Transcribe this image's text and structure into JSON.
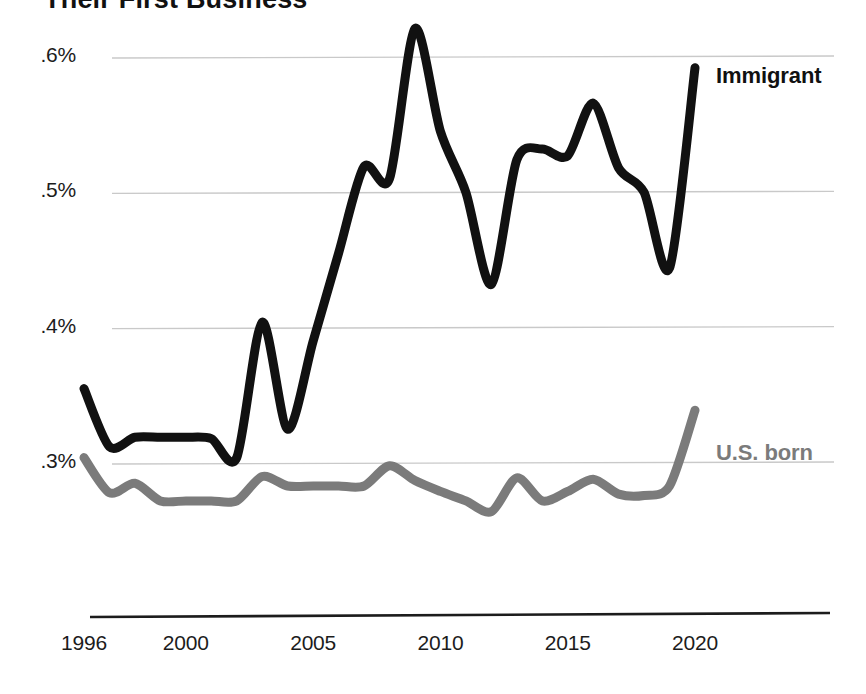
{
  "title": "Their First Business",
  "axes": {
    "y_ticks": [
      ".6%",
      ".5%",
      ".4%",
      ".3%"
    ],
    "x_ticks": [
      "1996",
      "2000",
      "2005",
      "2010",
      "2015",
      "2020"
    ]
  },
  "legend": {
    "immigrant": "Immigrant",
    "us_born": "U.S. born"
  },
  "colors": {
    "immigrant": "#111111",
    "us_born": "#7b7b7b",
    "gridline": "#c9c9c9",
    "axis": "#1c1c1c",
    "background": "#ffffff"
  },
  "chart_data": {
    "type": "line",
    "title": "Their First Business",
    "xlabel": "",
    "ylabel": "",
    "ylim": [
      0.28,
      0.63
    ],
    "xlim": [
      1996,
      2020
    ],
    "grid": true,
    "legend_position": "right-inline",
    "y_tick_values": [
      0.6,
      0.5,
      0.4,
      0.3
    ],
    "y_tick_labels": [
      ".6%",
      ".5%",
      ".4%",
      ".3%"
    ],
    "x_tick_values": [
      1996,
      2000,
      2005,
      2010,
      2015,
      2020
    ],
    "x_tick_labels": [
      "1996",
      "2000",
      "2005",
      "2010",
      "2015",
      "2020"
    ],
    "x": [
      1996,
      1997,
      1998,
      1999,
      2000,
      2001,
      2002,
      2003,
      2004,
      2005,
      2006,
      2007,
      2008,
      2009,
      2010,
      2011,
      2012,
      2013,
      2014,
      2015,
      2016,
      2017,
      2018,
      2019,
      2020
    ],
    "series": [
      {
        "name": "Immigrant",
        "color": "#111111",
        "values": [
          0.355,
          0.312,
          0.319,
          0.319,
          0.319,
          0.318,
          0.304,
          0.404,
          0.325,
          0.39,
          0.455,
          0.519,
          0.51,
          0.621,
          0.545,
          0.5,
          0.432,
          0.524,
          0.532,
          0.527,
          0.566,
          0.518,
          0.5,
          0.444,
          0.592
        ]
      },
      {
        "name": "U.S. born",
        "color": "#7b7b7b",
        "values": [
          0.304,
          0.278,
          0.285,
          0.272,
          0.272,
          0.272,
          0.272,
          0.29,
          0.283,
          0.283,
          0.283,
          0.283,
          0.298,
          0.287,
          0.279,
          0.272,
          0.264,
          0.289,
          0.272,
          0.279,
          0.288,
          0.277,
          0.276,
          0.283,
          0.339
        ]
      }
    ]
  }
}
